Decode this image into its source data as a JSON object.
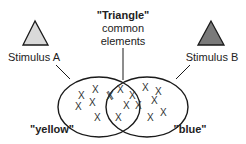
{
  "diagram": {
    "type": "venn",
    "center_label": {
      "title": "\"Triangle\"",
      "line2": "common",
      "line3": "elements"
    },
    "stimuli": [
      {
        "label": "Stimulus A",
        "shape": "triangle",
        "fill": "#d9d9d9"
      },
      {
        "label": "Stimulus B",
        "shape": "triangle",
        "fill": "#7a7a7a"
      }
    ],
    "sets": [
      {
        "label": "\"yellow\"",
        "unique_elements": 6
      },
      {
        "label": "\"blue\"",
        "unique_elements": 6
      }
    ],
    "intersection_elements": 5,
    "element_glyph": "X",
    "colors": {
      "stroke": "#1a1a1a",
      "text": "#222222",
      "background": "#ffffff"
    }
  }
}
